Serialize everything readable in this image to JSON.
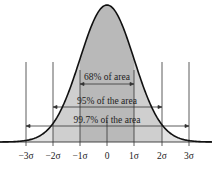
{
  "chart_data": {
    "type": "area",
    "title": "",
    "xlabel": "",
    "ylabel": "",
    "x_ticks": [
      "−3σ",
      "−2σ",
      "−1σ",
      "0",
      "1σ",
      "2σ",
      "3σ"
    ],
    "x_tick_values": [
      -3,
      -2,
      -1,
      0,
      1,
      2,
      3
    ],
    "xlim": [
      -3.7,
      3.7
    ],
    "curve": "standard normal density",
    "bands": [
      {
        "range": [
          -1,
          1
        ],
        "label": "68% of area",
        "percent": 68
      },
      {
        "range": [
          -2,
          2
        ],
        "label": "95% of the area",
        "percent": 95
      },
      {
        "range": [
          -3,
          3
        ],
        "label": "99.7% of the area",
        "percent": 99.7
      }
    ],
    "colors": {
      "curve": "#111111",
      "band_1sigma": "#b9b9b9",
      "band_2sigma": "#cfcfcf",
      "band_3sigma": "#e2e2e2",
      "lines": "#333333"
    },
    "grid": false
  },
  "labels": {
    "band1": "68% of area",
    "band2": "95% of the area",
    "band3": "99.7% of the area",
    "tick_m3": "−3σ",
    "tick_m2": "−2σ",
    "tick_m1": "−1σ",
    "tick_0": "0",
    "tick_p1": "1σ",
    "tick_p2": "2σ",
    "tick_p3": "3σ"
  }
}
